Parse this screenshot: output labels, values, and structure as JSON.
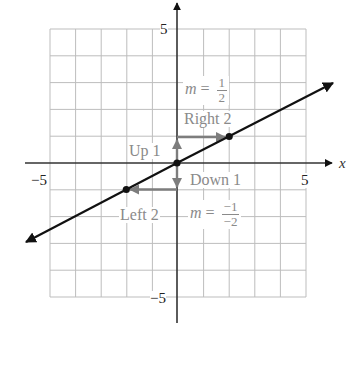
{
  "diagram": {
    "axes": {
      "x_label": "x",
      "x_range": [
        -5,
        5
      ],
      "y_range": [
        -5,
        5
      ],
      "ticks": {
        "x_neg": "−5",
        "x_pos": "5",
        "y_pos": "5",
        "y_neg": "−5"
      }
    },
    "grid": {
      "spacing": 1,
      "color": "#bdbdbd"
    },
    "line": {
      "equation": "y = x/2",
      "color": "#111111",
      "points": [
        [
          -2,
          -1
        ],
        [
          0,
          0
        ],
        [
          2,
          1
        ]
      ]
    },
    "arrows": {
      "color": "#7d7d7d",
      "up": {
        "from": [
          0,
          0
        ],
        "to": [
          0,
          1
        ],
        "label": "Up 1"
      },
      "right": {
        "from": [
          0,
          1
        ],
        "to": [
          2,
          1
        ],
        "label": "Right 2"
      },
      "down": {
        "from": [
          0,
          0
        ],
        "to": [
          0,
          -1
        ],
        "label": "Down 1"
      },
      "left": {
        "from": [
          0,
          -1
        ],
        "to": [
          -2,
          -1
        ],
        "label": "Left 2"
      }
    },
    "slope_labels": {
      "upper": {
        "var": "m",
        "eq": "=",
        "num": "1",
        "den": "2"
      },
      "lower": {
        "var": "m",
        "eq": "=",
        "num": "−1",
        "den": "−2"
      }
    },
    "label_color": "#8a8a8a"
  }
}
